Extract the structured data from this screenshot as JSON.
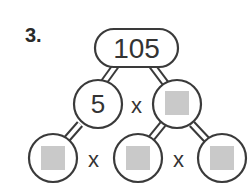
{
  "problem": {
    "number_label": "3.",
    "root": {
      "value": "105"
    },
    "level1": [
      {
        "value": "5",
        "blank": false
      },
      {
        "value": "",
        "blank": true
      }
    ],
    "level2": [
      {
        "value": "",
        "blank": true
      },
      {
        "value": "",
        "blank": true
      },
      {
        "value": "",
        "blank": true
      }
    ],
    "operators": {
      "level1": "x",
      "level2_a": "x",
      "level2_b": "x"
    }
  },
  "colors": {
    "outline": "#3a3a3a",
    "blank_fill": "#c9c9c9",
    "text": "#333333"
  }
}
